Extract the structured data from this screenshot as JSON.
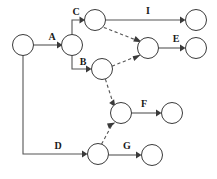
{
  "diagram": {
    "background_color": "#ffffff",
    "node_stroke_color": "#3a3a3a",
    "edge_color": "#555555",
    "label_color": "#1a1a1a",
    "node_radius": 10.5,
    "nodes": [
      {
        "id": "n1",
        "name": "start-node",
        "cx": 23,
        "cy": 45
      },
      {
        "id": "n2",
        "name": "split-node",
        "cx": 72,
        "cy": 45
      },
      {
        "id": "n3",
        "name": "upper-branch-node",
        "cx": 95,
        "cy": 20
      },
      {
        "id": "n4",
        "name": "merge-node",
        "cx": 148,
        "cy": 48
      },
      {
        "id": "n5",
        "name": "b-target-node",
        "cx": 102,
        "cy": 69
      },
      {
        "id": "n6",
        "name": "f-source-node",
        "cx": 121,
        "cy": 113
      },
      {
        "id": "n7",
        "name": "d-target-node",
        "cx": 98,
        "cy": 154
      },
      {
        "id": "n8",
        "name": "i-end-node",
        "cx": 196,
        "cy": 20
      },
      {
        "id": "n9",
        "name": "e-end-node",
        "cx": 196,
        "cy": 48
      },
      {
        "id": "n10",
        "name": "f-end-node",
        "cx": 172,
        "cy": 113
      },
      {
        "id": "n11",
        "name": "g-end-node",
        "cx": 152,
        "cy": 155
      }
    ],
    "edges": [
      {
        "name": "edge-a",
        "label": "A",
        "style": "solid",
        "from": "n1",
        "to": "n2",
        "label_x": 52,
        "label_y": 40
      },
      {
        "name": "edge-c",
        "label": "C",
        "style": "solid",
        "from": "n2",
        "to": "n3",
        "label_x": 76,
        "label_y": 15
      },
      {
        "name": "edge-b",
        "label": "B",
        "style": "solid",
        "from": "n2",
        "to": "n5",
        "label_x": 83,
        "label_y": 65
      },
      {
        "name": "edge-i",
        "label": "I",
        "style": "solid",
        "from": "n3",
        "to": "n8",
        "label_x": 148,
        "label_y": 14
      },
      {
        "name": "edge-e",
        "label": "E",
        "style": "solid",
        "from": "n4",
        "to": "n9",
        "label_x": 176,
        "label_y": 42
      },
      {
        "name": "edge-f",
        "label": "F",
        "style": "solid",
        "from": "n6",
        "to": "n10",
        "label_x": 144,
        "label_y": 107
      },
      {
        "name": "edge-d",
        "label": "D",
        "style": "solid",
        "from": "n1",
        "to": "n7",
        "label_x": 58,
        "label_y": 149
      },
      {
        "name": "edge-g",
        "label": "G",
        "style": "solid",
        "from": "n7",
        "to": "n11",
        "label_x": 127,
        "label_y": 149
      },
      {
        "name": "edge-c-to-merge",
        "label": "",
        "style": "dashed",
        "from": "n3",
        "to": "n4",
        "label_x": 0,
        "label_y": 0
      },
      {
        "name": "edge-b-to-merge",
        "label": "",
        "style": "dashed",
        "from": "n5",
        "to": "n4",
        "label_x": 0,
        "label_y": 0
      },
      {
        "name": "edge-b-to-f",
        "label": "",
        "style": "dashed",
        "from": "n5",
        "to": "n6",
        "label_x": 0,
        "label_y": 0
      },
      {
        "name": "edge-d-to-f",
        "label": "",
        "style": "dashed",
        "from": "n7",
        "to": "n6",
        "label_x": 0,
        "label_y": 0
      }
    ],
    "labels": {
      "a": "A",
      "b": "B",
      "c": "C",
      "d": "D",
      "e": "E",
      "f": "F",
      "g": "G",
      "i": "I"
    }
  }
}
